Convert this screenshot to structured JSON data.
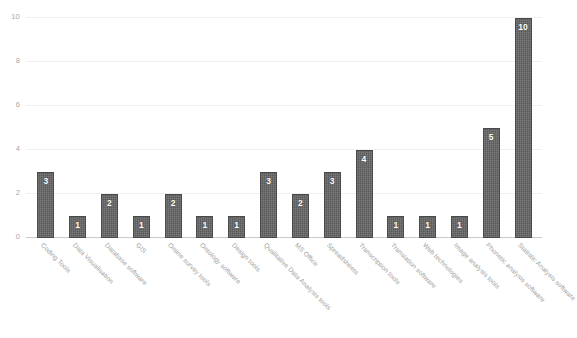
{
  "chart_data": {
    "type": "bar",
    "title": "",
    "subtitle": "",
    "xlabel": "",
    "ylabel": "",
    "ylim": [
      0,
      10
    ],
    "yticks": [
      0,
      2,
      4,
      6,
      8,
      10
    ],
    "grid": true,
    "legend": false,
    "legend_position": "none",
    "bar_color": "#595959",
    "bar_label_color": "#ffffff",
    "gridline_color": "#f0f0f0",
    "axis_color": "#c9c9c9",
    "tick_label_color": "#a8a8a8",
    "category_label_color": "#9e9e9e",
    "category_label_rotation": 45,
    "background_color": "#ffffff",
    "categories": [
      "Coding Tools",
      "Data Visualisation",
      "Database software",
      "GIS",
      "Online survey tools",
      "Ontology software",
      "Design tools",
      "Qualitative Data Analysis tools",
      "MS Office",
      "Spreadsheets",
      "Transcription tools",
      "Translation software",
      "Web technologies",
      "Image analysis tools",
      "Phonetic analysis software",
      "Statistic Analysis software"
    ],
    "values": [
      3,
      1,
      2,
      1,
      2,
      1,
      1,
      3,
      2,
      3,
      4,
      1,
      1,
      1,
      5,
      10
    ],
    "data_labels": [
      "3",
      "1",
      "2",
      "1",
      "2",
      "1",
      "1",
      "3",
      "2",
      "3",
      "4",
      "1",
      "1",
      "1",
      "5",
      "10"
    ],
    "ytick_labels": [
      "0",
      "2",
      "4",
      "6",
      "8",
      "10"
    ]
  }
}
